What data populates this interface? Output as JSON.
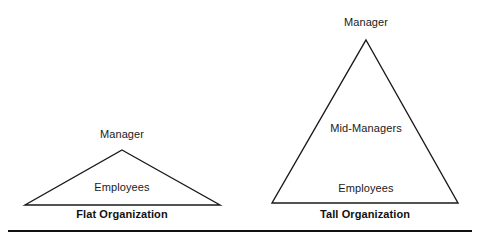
{
  "diagram": {
    "background_color": "#ffffff",
    "stroke_color": "#1a1a1a",
    "text_color": "#1a1a1a",
    "rule_color": "#111111",
    "units": [
      {
        "id": "flat",
        "caption": "Flat Organization",
        "shape": "triangle",
        "apex": {
          "x": 122,
          "y": 150
        },
        "base_left": {
          "x": 25,
          "y": 205
        },
        "base_right": {
          "x": 220,
          "y": 205
        },
        "levels": [
          {
            "label": "Manager",
            "position": "above-apex"
          },
          {
            "label": "Employees",
            "position": "inside-lower"
          }
        ]
      },
      {
        "id": "tall",
        "caption": "Tall Organization",
        "shape": "triangle",
        "apex": {
          "x": 366,
          "y": 40
        },
        "base_left": {
          "x": 272,
          "y": 203
        },
        "base_right": {
          "x": 458,
          "y": 203
        },
        "levels": [
          {
            "label": "Manager",
            "position": "above-apex"
          },
          {
            "label": "Mid-Managers",
            "position": "inside-middle"
          },
          {
            "label": "Employees",
            "position": "inside-lower"
          }
        ]
      }
    ],
    "footer_rule": {
      "x1": 8,
      "x2": 472,
      "y": 231,
      "thickness": 2
    }
  }
}
